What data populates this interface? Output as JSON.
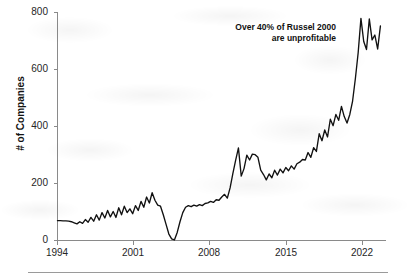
{
  "chart_data": {
    "type": "line",
    "title": "",
    "subtitle": "",
    "xlabel": "",
    "ylabel": "# of Companies",
    "xlim": [
      1994,
      2023.5
    ],
    "ylim": [
      0,
      850
    ],
    "grid": false,
    "legend": null,
    "legend_position": "none",
    "line_color": "#111111",
    "axis_color": "#8a8a8a",
    "xticks": [
      "1994",
      "2001",
      "2008",
      "2015",
      "2022"
    ],
    "xtick_values": [
      1994,
      2001,
      2008,
      2015,
      2022
    ],
    "yticks": [
      "0",
      "200",
      "400",
      "600",
      "800"
    ],
    "ytick_values": [
      0,
      200,
      400,
      600,
      800
    ],
    "annotations": [
      {
        "name": "russell-2000-callout",
        "line1": "Over 40% of Russel 2000",
        "line2": "are unprofitable",
        "align": "right"
      }
    ],
    "series": [
      {
        "name": "Unprofitable companies in Russell 2000",
        "x": [
          1994.0,
          1994.25,
          1994.5,
          1994.75,
          1995.0,
          1995.25,
          1995.5,
          1995.75,
          1996.0,
          1996.25,
          1996.5,
          1996.75,
          1997.0,
          1997.25,
          1997.5,
          1997.75,
          1998.0,
          1998.25,
          1998.5,
          1998.75,
          1999.0,
          1999.25,
          1999.5,
          1999.75,
          2000.0,
          2000.25,
          2000.5,
          2000.75,
          2001.0,
          2001.25,
          2001.5,
          2001.75,
          2002.0,
          2002.25,
          2002.5,
          2002.75,
          2003.0,
          2003.25,
          2003.5,
          2003.75,
          2004.0,
          2004.25,
          2004.5,
          2004.75,
          2005.0,
          2005.25,
          2005.5,
          2005.75,
          2006.0,
          2006.25,
          2006.5,
          2006.75,
          2007.0,
          2007.25,
          2007.5,
          2007.75,
          2008.0,
          2008.25,
          2008.5,
          2008.75,
          2009.0,
          2009.25,
          2009.5,
          2009.75,
          2010.0,
          2010.25,
          2010.5,
          2010.75,
          2011.0,
          2011.25,
          2011.5,
          2011.75,
          2012.0,
          2012.25,
          2012.5,
          2012.75,
          2013.0,
          2013.25,
          2013.5,
          2013.75,
          2014.0,
          2014.25,
          2014.5,
          2014.75,
          2015.0,
          2015.25,
          2015.5,
          2015.75,
          2016.0,
          2016.25,
          2016.5,
          2016.75,
          2017.0,
          2017.25,
          2017.5,
          2017.75,
          2018.0,
          2018.25,
          2018.5,
          2018.75,
          2019.0,
          2019.25,
          2019.5,
          2019.75,
          2020.0,
          2020.25,
          2020.5,
          2020.75,
          2021.0,
          2021.25,
          2021.5,
          2021.75,
          2022.0,
          2022.25,
          2022.5,
          2022.75,
          2023.0
        ],
        "values": [
          74,
          74,
          73,
          73,
          72,
          70,
          66,
          62,
          70,
          64,
          78,
          68,
          86,
          72,
          96,
          76,
          104,
          84,
          112,
          88,
          108,
          86,
          122,
          96,
          128,
          104,
          118,
          100,
          130,
          112,
          146,
          124,
          162,
          140,
          178,
          150,
          132,
          128,
          96,
          60,
          24,
          6,
          2,
          30,
          70,
          104,
          124,
          130,
          126,
          132,
          128,
          134,
          130,
          138,
          140,
          146,
          142,
          152,
          150,
          162,
          172,
          158,
          196,
          250,
          300,
          345,
          240,
          268,
          318,
          300,
          322,
          320,
          310,
          262,
          246,
          226,
          248,
          234,
          262,
          244,
          266,
          252,
          272,
          260,
          278,
          266,
          286,
          292,
          302,
          300,
          328,
          310,
          346,
          332,
          398,
          372,
          412,
          386,
          452,
          428,
          470,
          448,
          500,
          462,
          438,
          470,
          520,
          604,
          700,
          828,
          742,
          712,
          826,
          748,
          766,
          714,
          800
        ]
      }
    ]
  },
  "axis_titles": {
    "y": "# of Companies"
  },
  "page": {
    "separator_rule": true
  }
}
